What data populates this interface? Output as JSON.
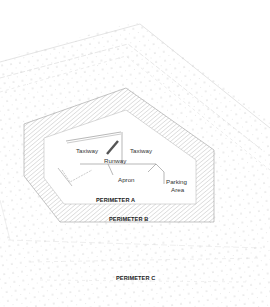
{
  "diagram": {
    "colors": {
      "background": "#ffffff",
      "dot": "#b8b8b8",
      "contour": "#cfcfcf",
      "hatch": "#9a9a9a",
      "outline": "#8a8a8a",
      "feature_line": "#888888",
      "text": "#333333"
    },
    "features": {
      "taxiway_left": "Taxiway",
      "taxiway_right": "Taxiway",
      "runway": "Runway",
      "apron": "Apron",
      "parking_line1": "Parking",
      "parking_line2": "Area"
    },
    "perimeters": {
      "a": "PERIMETER A",
      "b": "PERIMETER B",
      "c": "PERIMETER C"
    }
  }
}
